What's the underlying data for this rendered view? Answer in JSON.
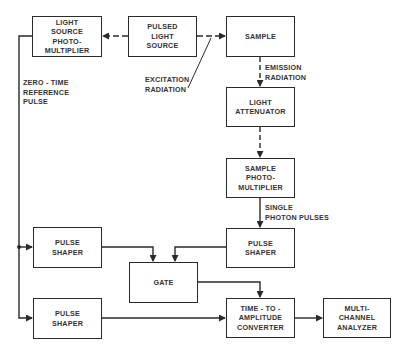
{
  "diagram": {
    "blocks": {
      "light_source_pm": "LIGHT\nSOURCE\nPHOTO-\nMULTIPLIER",
      "pulsed_light_source": "PULSED\nLIGHT\nSOURCE",
      "sample": "SAMPLE",
      "light_attenuator": "LIGHT\nATTENUATOR",
      "sample_pm": "SAMPLE\nPHOTO-\nMULTIPLIER",
      "pulse_shaper_right": "PULSE\nSHAPER",
      "pulse_shaper_left_top": "PULSE\nSHAPER",
      "gate": "GATE",
      "pulse_shaper_left_bottom": "PULSE\nSHAPER",
      "tac": "TIME - TO -\nAMPLITUDE\nCONVERTER",
      "mca": "MULTI-\nCHANNEL\nANALYZER"
    },
    "labels": {
      "zero_time": "ZERO - TIME\nREFERENCE\nPULSE",
      "excitation": "EXCITATION\nRADIATION",
      "emission": "EMISSION\nRADIATION",
      "single_photon": "SINGLE\nPHOTON PULSES"
    },
    "line_color": "#2a2a2a"
  }
}
